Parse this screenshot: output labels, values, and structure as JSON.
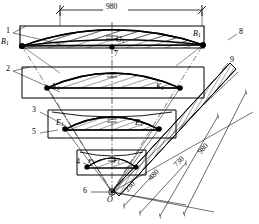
{
  "diagram": {
    "overall_dimension": "980",
    "centre_point_label": "O",
    "centre_point_callout": "6",
    "upper_centre_label": "O",
    "upper_centre_sub": "1",
    "upper_centre_callout": "7",
    "callouts": [
      {
        "id": "c1",
        "text": "1",
        "x": 6,
        "y": 30
      },
      {
        "id": "c2",
        "text": "2",
        "x": 6,
        "y": 68
      },
      {
        "id": "c3",
        "text": "3",
        "x": 33,
        "y": 110
      },
      {
        "id": "c5",
        "text": "5",
        "x": 33,
        "y": 131
      },
      {
        "id": "c4",
        "text": "4",
        "x": 76,
        "y": 160
      },
      {
        "id": "c6",
        "text": "6",
        "x": 84,
        "y": 190
      },
      {
        "id": "c7",
        "text": "7",
        "x": 113,
        "y": 53
      },
      {
        "id": "c8",
        "text": "8",
        "x": 238,
        "y": 31
      },
      {
        "id": "c9",
        "text": "9",
        "x": 228,
        "y": 59
      }
    ],
    "point_labels": [
      {
        "id": "B-left",
        "letter": "B",
        "sub": "1",
        "x": 3,
        "y": 40
      },
      {
        "id": "B-right",
        "letter": "B",
        "sub": "1",
        "x": 196,
        "y": 33
      },
      {
        "id": "K-left",
        "letter": "K",
        "sub": "1",
        "x": 53,
        "y": 85
      },
      {
        "id": "K-right",
        "letter": "K",
        "sub": "1",
        "x": 157,
        "y": 85
      },
      {
        "id": "E-left",
        "letter": "E",
        "sub": "1",
        "x": 57,
        "y": 122
      },
      {
        "id": "E-right",
        "letter": "E",
        "sub": "1",
        "x": 136,
        "y": 122
      },
      {
        "id": "F-left",
        "letter": "F",
        "sub": "1",
        "x": 89,
        "y": 161
      },
      {
        "id": "F-right",
        "letter": "F",
        "sub": "1",
        "x": 112,
        "y": 161
      }
    ],
    "radial_dimensions": [
      {
        "id": "r230",
        "text": "230",
        "x": 128,
        "y": 188,
        "rot": -47
      },
      {
        "id": "r480",
        "text": "480",
        "x": 152,
        "y": 175,
        "rot": -47
      },
      {
        "id": "r730",
        "text": "730",
        "x": 176,
        "y": 162,
        "rot": -47
      },
      {
        "id": "r980",
        "text": "980",
        "x": 200,
        "y": 149,
        "rot": -47
      }
    ],
    "top_dimension": {
      "text": "980",
      "x": 115,
      "y": 5
    }
  },
  "colors": {
    "line": "#000000",
    "background": "#ffffff",
    "hatch": "#1a1a1a"
  }
}
